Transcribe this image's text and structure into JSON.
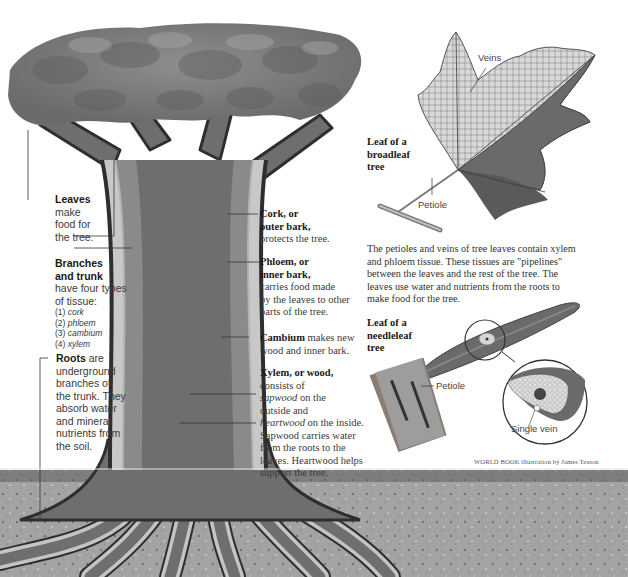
{
  "header": {
    "cropped_text": ""
  },
  "tree_labels": {
    "leaves": {
      "title": "Leaves",
      "text": [
        "make",
        "food for",
        "the tree."
      ]
    },
    "branches": {
      "title_lines": [
        "Branches",
        "and trunk"
      ],
      "text": [
        "have four types",
        "of tissue:"
      ],
      "list": [
        {
          "num": "(1)",
          "term": "cork"
        },
        {
          "num": "(2)",
          "term": "phloem"
        },
        {
          "num": "(3)",
          "term": "cambium"
        },
        {
          "num": "(4)",
          "term": "xylem"
        }
      ]
    },
    "roots": {
      "title": "Roots",
      "text": [
        " are",
        "underground",
        "branches of",
        "the trunk. They",
        "absorb water",
        "and mineral",
        "nutrients from",
        "the soil."
      ]
    },
    "cork": {
      "title_lines": [
        "Cork, or",
        "outer bark,"
      ],
      "text": [
        "protects the tree."
      ]
    },
    "phloem": {
      "title_lines": [
        "Phloem, or",
        "inner bark,"
      ],
      "text": [
        "carries food made",
        "by the leaves to other",
        "parts of the tree."
      ]
    },
    "cambium": {
      "title": "Cambium",
      "text_first": " makes new",
      "text": [
        "wood and inner bark."
      ]
    },
    "xylem": {
      "title": "Xylem, or wood,",
      "line1": "consists of",
      "sapwood": "sapwood",
      "sapwood_rest": " on the",
      "line3": "outside and",
      "heartwood": "heartwood",
      "heartwood_rest": " on the inside.",
      "text": [
        "Sapwood carries water",
        "from the roots to the",
        "leaves. Heartwood helps",
        "support the tree."
      ]
    }
  },
  "broadleaf": {
    "title_lines": [
      "Leaf of a",
      "broadleaf",
      "tree"
    ],
    "veins_label": "Veins",
    "petiole_label": "Petiole"
  },
  "paragraph": {
    "lines": [
      "The petioles and veins of tree leaves contain xylem",
      "and phloem tissue. These tissues are \"pipelines\"",
      "between the leaves and the rest of the tree. The",
      "leaves use water and nutrients from the roots to",
      "make food for the tree."
    ]
  },
  "needleleaf": {
    "title_lines": [
      "Leaf of a",
      "needleleaf",
      "tree"
    ],
    "petiole_label": "Petiole",
    "vein_label": "Single vein"
  },
  "credit": "WORLD BOOK illustration by James Teason",
  "colors": {
    "heartwood": "#6e6e6e",
    "sapwood": "#8a8a8a",
    "cambium": "#b9b9b9",
    "phloem": "#c8c8c8",
    "cork": "#3a3a3a",
    "soil": "#9c9c9c",
    "canopy": "#7d7d7d"
  }
}
